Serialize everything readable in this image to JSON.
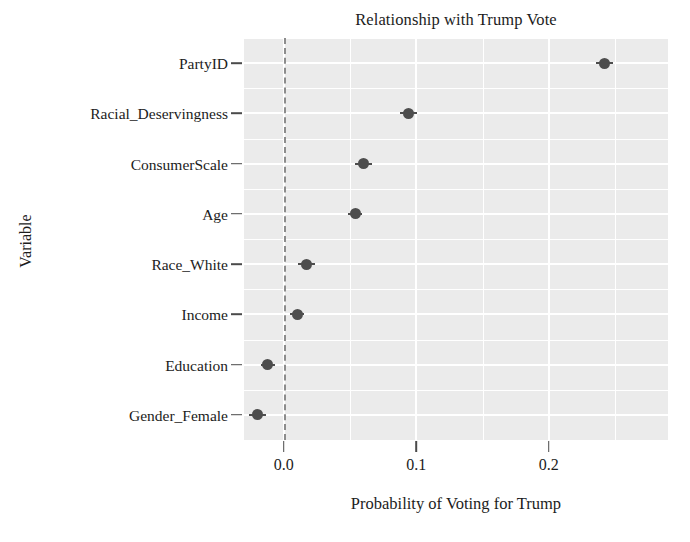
{
  "chart_data": {
    "type": "scatter",
    "title": "Relationship with Trump Vote",
    "xlabel": "Probability of Voting for Trump",
    "ylabel": "Variable",
    "xlim": [
      -0.03,
      0.29
    ],
    "xticks": [
      0.0,
      0.1,
      0.2
    ],
    "xticklabels": [
      "0.0",
      "0.1",
      "0.2"
    ],
    "grid": true,
    "legend": null,
    "reference_line": {
      "value": 0.0,
      "style": "dashed",
      "color": "#8c8c8c"
    },
    "point_color": "#4d4d4d",
    "panel_color": "#ebebeb",
    "gridline_color": "#ffffff",
    "categories": [
      "PartyID",
      "Racial_Deservingness",
      "ConsumerScale",
      "Age",
      "Race_White",
      "Income",
      "Education",
      "Gender_Female"
    ],
    "values": [
      0.242,
      0.094,
      0.06,
      0.054,
      0.017,
      0.01,
      -0.012,
      -0.02
    ],
    "points": [
      {
        "label": "PartyID",
        "value": 0.242,
        "err": 0.004
      },
      {
        "label": "Racial_Deservingness",
        "value": 0.094,
        "err": 0.004
      },
      {
        "label": "ConsumerScale",
        "value": 0.06,
        "err": 0.004
      },
      {
        "label": "Age",
        "value": 0.054,
        "err": 0.003
      },
      {
        "label": "Race_White",
        "value": 0.017,
        "err": 0.004
      },
      {
        "label": "Income",
        "value": 0.01,
        "err": 0.003
      },
      {
        "label": "Education",
        "value": -0.012,
        "err": 0.003
      },
      {
        "label": "Gender_Female",
        "value": -0.02,
        "err": 0.004
      }
    ]
  }
}
